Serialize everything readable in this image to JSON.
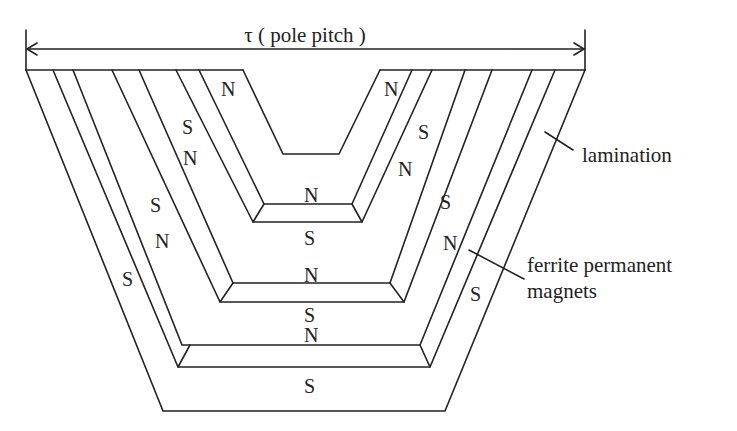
{
  "diagram": {
    "title": "τ ( pole pitch )",
    "callouts": {
      "lamination": "lamination",
      "ferrite_line1": "ferrite permanent",
      "ferrite_line2": "magnets"
    },
    "poles": {
      "notch_left": "N",
      "notch_right": "N",
      "left_s1": "S",
      "left_n1": "N",
      "left_s2": "S",
      "left_n2": "N",
      "left_s3": "S",
      "right_s1": "S",
      "right_n1": "N",
      "right_s2": "S",
      "right_n2": "N",
      "right_s3": "S",
      "center_n1": "N",
      "center_s1": "S",
      "center_n2": "N",
      "center_s2": "S",
      "center_n3": "N",
      "center_s3": "S"
    },
    "colors": {
      "line": "#222222",
      "background": "#ffffff"
    }
  }
}
